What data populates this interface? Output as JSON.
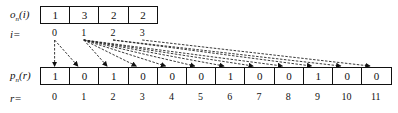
{
  "top_row": {
    "label_main": "o",
    "label_sub": "n",
    "label_arg": "(i)",
    "index_label": "i=",
    "values": [
      "1",
      "3",
      "2",
      "2"
    ],
    "indices": [
      "0",
      "1",
      "2",
      "3"
    ]
  },
  "bottom_row": {
    "label_main": "p",
    "label_sub": "n",
    "label_arg": "(r)",
    "index_label": "r=",
    "values": [
      "1",
      "0",
      "1",
      "0",
      "0",
      "0",
      "1",
      "0",
      "0",
      "1",
      "0",
      "0"
    ],
    "indices": [
      "0",
      "1",
      "2",
      "3",
      "4",
      "5",
      "6",
      "7",
      "8",
      "9",
      "10",
      "11"
    ]
  },
  "arrows": [
    {
      "from": 0,
      "to": 0
    },
    {
      "from": 0,
      "to": 1
    },
    {
      "from": 1,
      "to": 2
    },
    {
      "from": 1,
      "to": 3
    },
    {
      "from": 1,
      "to": 4
    },
    {
      "from": 1,
      "to": 5
    },
    {
      "from": 1,
      "to": 6
    },
    {
      "from": 1,
      "to": 7
    },
    {
      "from": 1,
      "to": 8
    },
    {
      "from": 2,
      "to": 9
    },
    {
      "from": 2,
      "to": 10
    },
    {
      "from": 3,
      "to": 11
    }
  ]
}
